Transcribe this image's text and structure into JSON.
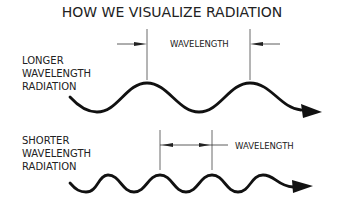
{
  "title": "HOW WE VISUALIZE RADIATION",
  "long_wave": {
    "label_lines": [
      "LONGER",
      "WAVELENGTH",
      "RADIATION"
    ],
    "wavelength_label": "WAVELENGTH",
    "cycles": 2
  },
  "short_wave": {
    "label_lines": [
      "SHORTER",
      "WAVELENGTH",
      "RADIATION"
    ],
    "wavelength_label": "WAVELENGTH",
    "cycles": 4
  },
  "colors": {
    "stroke": "#111111",
    "text": "#222222",
    "background": "#ffffff"
  }
}
